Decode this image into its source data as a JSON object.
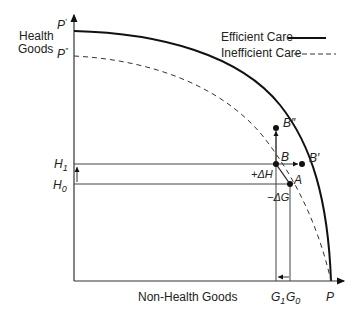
{
  "axes": {
    "y_label_line1": "Health",
    "y_label_line2": "Goods",
    "x_label": "Non-Health Goods"
  },
  "legend": {
    "efficient": "Efficient Care",
    "inefficient": "Inefficient Care"
  },
  "intercepts": {
    "p_prime": "P",
    "p_prime_sup": "′",
    "p_double": "P",
    "p_double_sup": "″",
    "p": "P"
  },
  "y_ticks": {
    "h1": "H",
    "h1_sub": "1",
    "h0": "H",
    "h0_sub": "0"
  },
  "x_ticks": {
    "g1": "G",
    "g1_sub": "1",
    "g0": "G",
    "g0_sub": "0"
  },
  "points": {
    "a": "A",
    "b": "B",
    "b_prime": "B′",
    "b_double": "B″"
  },
  "annotations": {
    "delta_h": "+ΔH",
    "delta_g": "−ΔG"
  },
  "colors": {
    "line": "#1a1a1a",
    "guide": "#333333"
  }
}
